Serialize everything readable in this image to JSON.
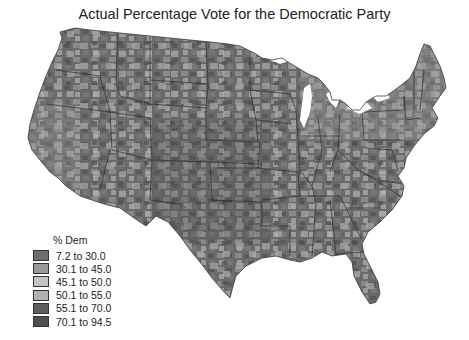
{
  "title": "Actual Percentage Vote for the Democratic Party",
  "legend": {
    "title": "% Dem",
    "items": [
      {
        "label": "7.2 to 30.0",
        "color": "#6e6e6e"
      },
      {
        "label": "30.1 to 45.0",
        "color": "#9a9a9a"
      },
      {
        "label": "45.1 to 50.0",
        "color": "#c4c4c4"
      },
      {
        "label": "50.1 to 55.0",
        "color": "#b2b2b2"
      },
      {
        "label": "55.1 to 70.0",
        "color": "#5e5e5e"
      },
      {
        "label": "70.1 to 94.5",
        "color": "#4f4f4f"
      }
    ]
  },
  "map": {
    "type": "choropleth",
    "region": "Contiguous United States",
    "unit": "county",
    "colors": {
      "land_base": "#6a6a6a",
      "state_border": "#2e2e2e",
      "water": "#ffffff"
    }
  }
}
